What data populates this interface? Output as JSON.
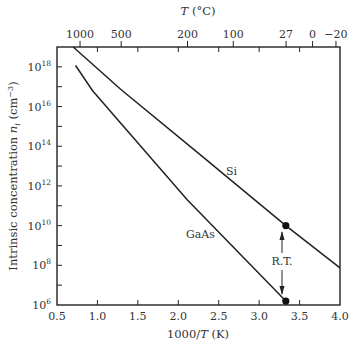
{
  "chart_data": {
    "type": "line",
    "title": "",
    "xlabel": "1000/T (K)",
    "ylabel": "Intrinsic concentration n_i (cm^-3)",
    "top_xlabel": "T (°C)",
    "xlim": [
      0.5,
      4.0
    ],
    "ylim_log10": [
      6,
      19
    ],
    "yscale": "log",
    "grid": false,
    "legend": null,
    "x_ticks": [
      "0.5",
      "1.0",
      "1.5",
      "2.0",
      "2.5",
      "3.0",
      "3.5",
      "4.0"
    ],
    "y_ticks": [
      "10^6",
      "10^8",
      "10^10",
      "10^12",
      "10^14",
      "10^16",
      "10^18"
    ],
    "top_ticks": [
      {
        "label": "1000",
        "x": 0.785
      },
      {
        "label": "500",
        "x": 1.294
      },
      {
        "label": "200",
        "x": 2.114
      },
      {
        "label": "100",
        "x": 2.68
      },
      {
        "label": "27",
        "x": 3.333
      },
      {
        "label": "0",
        "x": 3.661
      },
      {
        "label": "−20",
        "x": 3.95
      }
    ],
    "series": [
      {
        "name": "Si",
        "x": [
          0.7,
          1.29,
          2.27,
          3.33,
          4.0
        ],
        "log10_y": [
          19.0,
          16.86,
          13.58,
          10.0,
          7.87
        ]
      },
      {
        "name": "GaAs",
        "x": [
          0.73,
          0.94,
          2.11,
          3.33
        ],
        "log10_y": [
          18.07,
          16.8,
          11.3,
          6.2
        ]
      }
    ],
    "annotations": [
      {
        "text": "R.T.",
        "x": 3.33,
        "note": "double arrow between Si and GaAs room-temperature points"
      },
      {
        "text": "Si",
        "x": 2.37,
        "log10_y": 12.9
      },
      {
        "text": "GaAs",
        "x": 2.0,
        "log10_y": 9.8
      }
    ],
    "markers": [
      {
        "series": "Si",
        "x": 3.33,
        "log10_y": 10.0
      },
      {
        "series": "GaAs",
        "x": 3.33,
        "log10_y": 6.2
      }
    ]
  },
  "labels": {
    "top_axis_title_T": "T",
    "top_axis_title_unit": " (°C)",
    "bottom_axis_title_num": "1000/",
    "bottom_axis_title_T": "T",
    "bottom_axis_title_unit": " (K)",
    "y_axis_title_main": "Intrinsic concentration ",
    "y_axis_title_n": "n",
    "y_axis_title_sub": "i",
    "y_axis_title_unit": " (cm",
    "y_axis_title_exp": "−3",
    "y_axis_title_close": ")",
    "si_label": "Si",
    "gaas_label": "GaAs",
    "rt_label": "R.T."
  }
}
